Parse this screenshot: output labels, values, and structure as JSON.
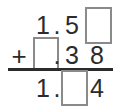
{
  "worksheet": {
    "type": "vertical-addition-with-blanks",
    "operator": "+",
    "decimal_point": ".",
    "rows": [
      {
        "name": "addend-1",
        "cells": [
          {
            "kind": "digit",
            "value": "1"
          },
          {
            "kind": "point",
            "value": "."
          },
          {
            "kind": "digit",
            "value": "5"
          },
          {
            "kind": "blank",
            "value": ""
          }
        ]
      },
      {
        "name": "addend-2",
        "operator": "+",
        "cells": [
          {
            "kind": "blank",
            "value": ""
          },
          {
            "kind": "point",
            "value": "."
          },
          {
            "kind": "digit",
            "value": "3"
          },
          {
            "kind": "digit",
            "value": "8"
          }
        ]
      },
      {
        "name": "sum",
        "cells": [
          {
            "kind": "digit",
            "value": "1"
          },
          {
            "kind": "point",
            "value": "."
          },
          {
            "kind": "blank",
            "value": ""
          },
          {
            "kind": "digit",
            "value": "4"
          }
        ]
      }
    ]
  },
  "colors": {
    "ink": "#2b2b2b",
    "box_border": "#8a8a8a",
    "background": "#ffffff"
  }
}
